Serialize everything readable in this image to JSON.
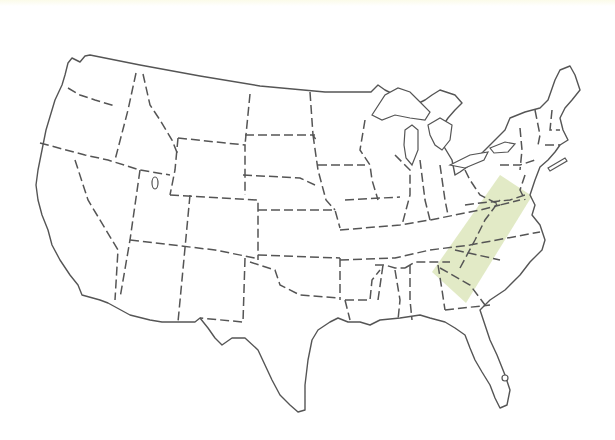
{
  "map": {
    "subject": "Contiguous United States outline with dashed state borders",
    "highlight": {
      "label": "Appalachian region highlight band",
      "color": "#dfe8c0",
      "polygon": [
        [
          500,
          175
        ],
        [
          532,
          196
        ],
        [
          466,
          303
        ],
        [
          432,
          272
        ]
      ]
    },
    "colors": {
      "outline": "#555555",
      "background": "#ffffff",
      "highlight": "#dfe8c0"
    }
  }
}
